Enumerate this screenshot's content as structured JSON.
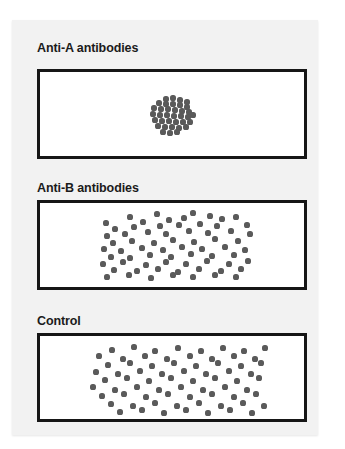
{
  "figure": {
    "title_visible": false,
    "background_color": "#ffffff",
    "card_color": "#f2f2f2",
    "border_color": "#161616",
    "dot_color": "#5a5a5a",
    "panel_fill": "#ffffff"
  },
  "panels": [
    {
      "id": "anti-a",
      "label": "Anti-A antibodies",
      "result": "agglutinated",
      "box": {
        "x": 37,
        "y": 69,
        "w": 270,
        "h": 90
      },
      "label_pos": {
        "x": 37,
        "y": 41
      },
      "dot_radius": 2.6,
      "dots": [
        [
          163,
          96
        ],
        [
          170,
          95
        ],
        [
          177,
          97
        ],
        [
          184,
          99
        ],
        [
          156,
          100
        ],
        [
          163,
          101
        ],
        [
          170,
          101
        ],
        [
          177,
          102
        ],
        [
          184,
          104
        ],
        [
          151,
          105
        ],
        [
          158,
          106
        ],
        [
          165,
          106
        ],
        [
          172,
          107
        ],
        [
          179,
          108
        ],
        [
          186,
          109
        ],
        [
          150,
          111
        ],
        [
          157,
          112
        ],
        [
          164,
          112
        ],
        [
          171,
          113
        ],
        [
          178,
          113
        ],
        [
          185,
          114
        ],
        [
          190,
          112
        ],
        [
          152,
          117
        ],
        [
          159,
          118
        ],
        [
          166,
          118
        ],
        [
          173,
          119
        ],
        [
          180,
          119
        ],
        [
          187,
          119
        ],
        [
          155,
          123
        ],
        [
          162,
          124
        ],
        [
          169,
          124
        ],
        [
          176,
          125
        ],
        [
          183,
          124
        ],
        [
          160,
          129
        ],
        [
          167,
          130
        ],
        [
          174,
          129
        ]
      ]
    },
    {
      "id": "anti-b",
      "label": "Anti-B antibodies",
      "result": "dispersed",
      "box": {
        "x": 37,
        "y": 200,
        "w": 270,
        "h": 90
      },
      "label_pos": {
        "x": 37,
        "y": 181
      },
      "dot_radius": 2.6,
      "dots": [
        [
          127,
          214
        ],
        [
          154,
          211
        ],
        [
          181,
          215
        ],
        [
          207,
          213
        ],
        [
          190,
          210
        ],
        [
          103,
          220
        ],
        [
          140,
          219
        ],
        [
          166,
          217
        ],
        [
          219,
          216
        ],
        [
          233,
          214
        ],
        [
          112,
          226
        ],
        [
          131,
          224
        ],
        [
          157,
          223
        ],
        [
          176,
          222
        ],
        [
          197,
          221
        ],
        [
          214,
          223
        ],
        [
          244,
          222
        ],
        [
          104,
          233
        ],
        [
          122,
          231
        ],
        [
          145,
          229
        ],
        [
          163,
          231
        ],
        [
          186,
          228
        ],
        [
          205,
          230
        ],
        [
          228,
          228
        ],
        [
          247,
          231
        ],
        [
          110,
          240
        ],
        [
          129,
          238
        ],
        [
          151,
          240
        ],
        [
          170,
          237
        ],
        [
          191,
          239
        ],
        [
          212,
          236
        ],
        [
          235,
          238
        ],
        [
          101,
          246
        ],
        [
          118,
          248
        ],
        [
          139,
          245
        ],
        [
          160,
          247
        ],
        [
          179,
          244
        ],
        [
          199,
          246
        ],
        [
          222,
          244
        ],
        [
          242,
          247
        ],
        [
          108,
          254
        ],
        [
          127,
          255
        ],
        [
          147,
          252
        ],
        [
          168,
          254
        ],
        [
          188,
          251
        ],
        [
          209,
          253
        ],
        [
          231,
          252
        ],
        [
          100,
          261
        ],
        [
          120,
          259
        ],
        [
          143,
          262
        ],
        [
          163,
          259
        ],
        [
          183,
          261
        ],
        [
          204,
          258
        ],
        [
          226,
          261
        ],
        [
          245,
          258
        ],
        [
          111,
          267
        ],
        [
          134,
          268
        ],
        [
          155,
          266
        ],
        [
          175,
          269
        ],
        [
          196,
          266
        ],
        [
          218,
          268
        ],
        [
          238,
          266
        ],
        [
          104,
          274
        ],
        [
          126,
          272
        ],
        [
          148,
          275
        ],
        [
          170,
          272
        ],
        [
          190,
          274
        ],
        [
          212,
          272
        ],
        [
          233,
          274
        ]
      ]
    },
    {
      "id": "control",
      "label": "Control",
      "result": "dispersed",
      "box": {
        "x": 37,
        "y": 333,
        "w": 270,
        "h": 89
      },
      "label_pos": {
        "x": 37,
        "y": 314
      },
      "dot_radius": 2.6,
      "dots": [
        [
          109,
          347
        ],
        [
          131,
          344
        ],
        [
          152,
          348
        ],
        [
          175,
          345
        ],
        [
          198,
          348
        ],
        [
          220,
          345
        ],
        [
          241,
          348
        ],
        [
          262,
          345
        ],
        [
          96,
          353
        ],
        [
          120,
          356
        ],
        [
          142,
          353
        ],
        [
          164,
          356
        ],
        [
          187,
          353
        ],
        [
          209,
          356
        ],
        [
          231,
          353
        ],
        [
          252,
          356
        ],
        [
          105,
          362
        ],
        [
          127,
          360
        ],
        [
          149,
          363
        ],
        [
          171,
          360
        ],
        [
          193,
          363
        ],
        [
          215,
          360
        ],
        [
          238,
          363
        ],
        [
          258,
          360
        ],
        [
          93,
          369
        ],
        [
          115,
          371
        ],
        [
          137,
          368
        ],
        [
          159,
          371
        ],
        [
          181,
          368
        ],
        [
          203,
          371
        ],
        [
          226,
          368
        ],
        [
          248,
          371
        ],
        [
          102,
          377
        ],
        [
          124,
          375
        ],
        [
          146,
          378
        ],
        [
          168,
          375
        ],
        [
          190,
          378
        ],
        [
          212,
          375
        ],
        [
          234,
          378
        ],
        [
          256,
          375
        ],
        [
          90,
          384
        ],
        [
          112,
          387
        ],
        [
          134,
          384
        ],
        [
          156,
          387
        ],
        [
          178,
          384
        ],
        [
          200,
          387
        ],
        [
          222,
          384
        ],
        [
          244,
          387
        ],
        [
          99,
          393
        ],
        [
          121,
          391
        ],
        [
          143,
          394
        ],
        [
          165,
          391
        ],
        [
          187,
          394
        ],
        [
          209,
          391
        ],
        [
          231,
          394
        ],
        [
          253,
          391
        ],
        [
          108,
          401
        ],
        [
          130,
          403
        ],
        [
          152,
          400
        ],
        [
          174,
          403
        ],
        [
          196,
          400
        ],
        [
          218,
          403
        ],
        [
          240,
          400
        ],
        [
          261,
          403
        ],
        [
          117,
          409
        ],
        [
          139,
          407
        ],
        [
          161,
          410
        ],
        [
          183,
          407
        ],
        [
          205,
          410
        ],
        [
          227,
          407
        ],
        [
          249,
          410
        ]
      ]
    }
  ]
}
